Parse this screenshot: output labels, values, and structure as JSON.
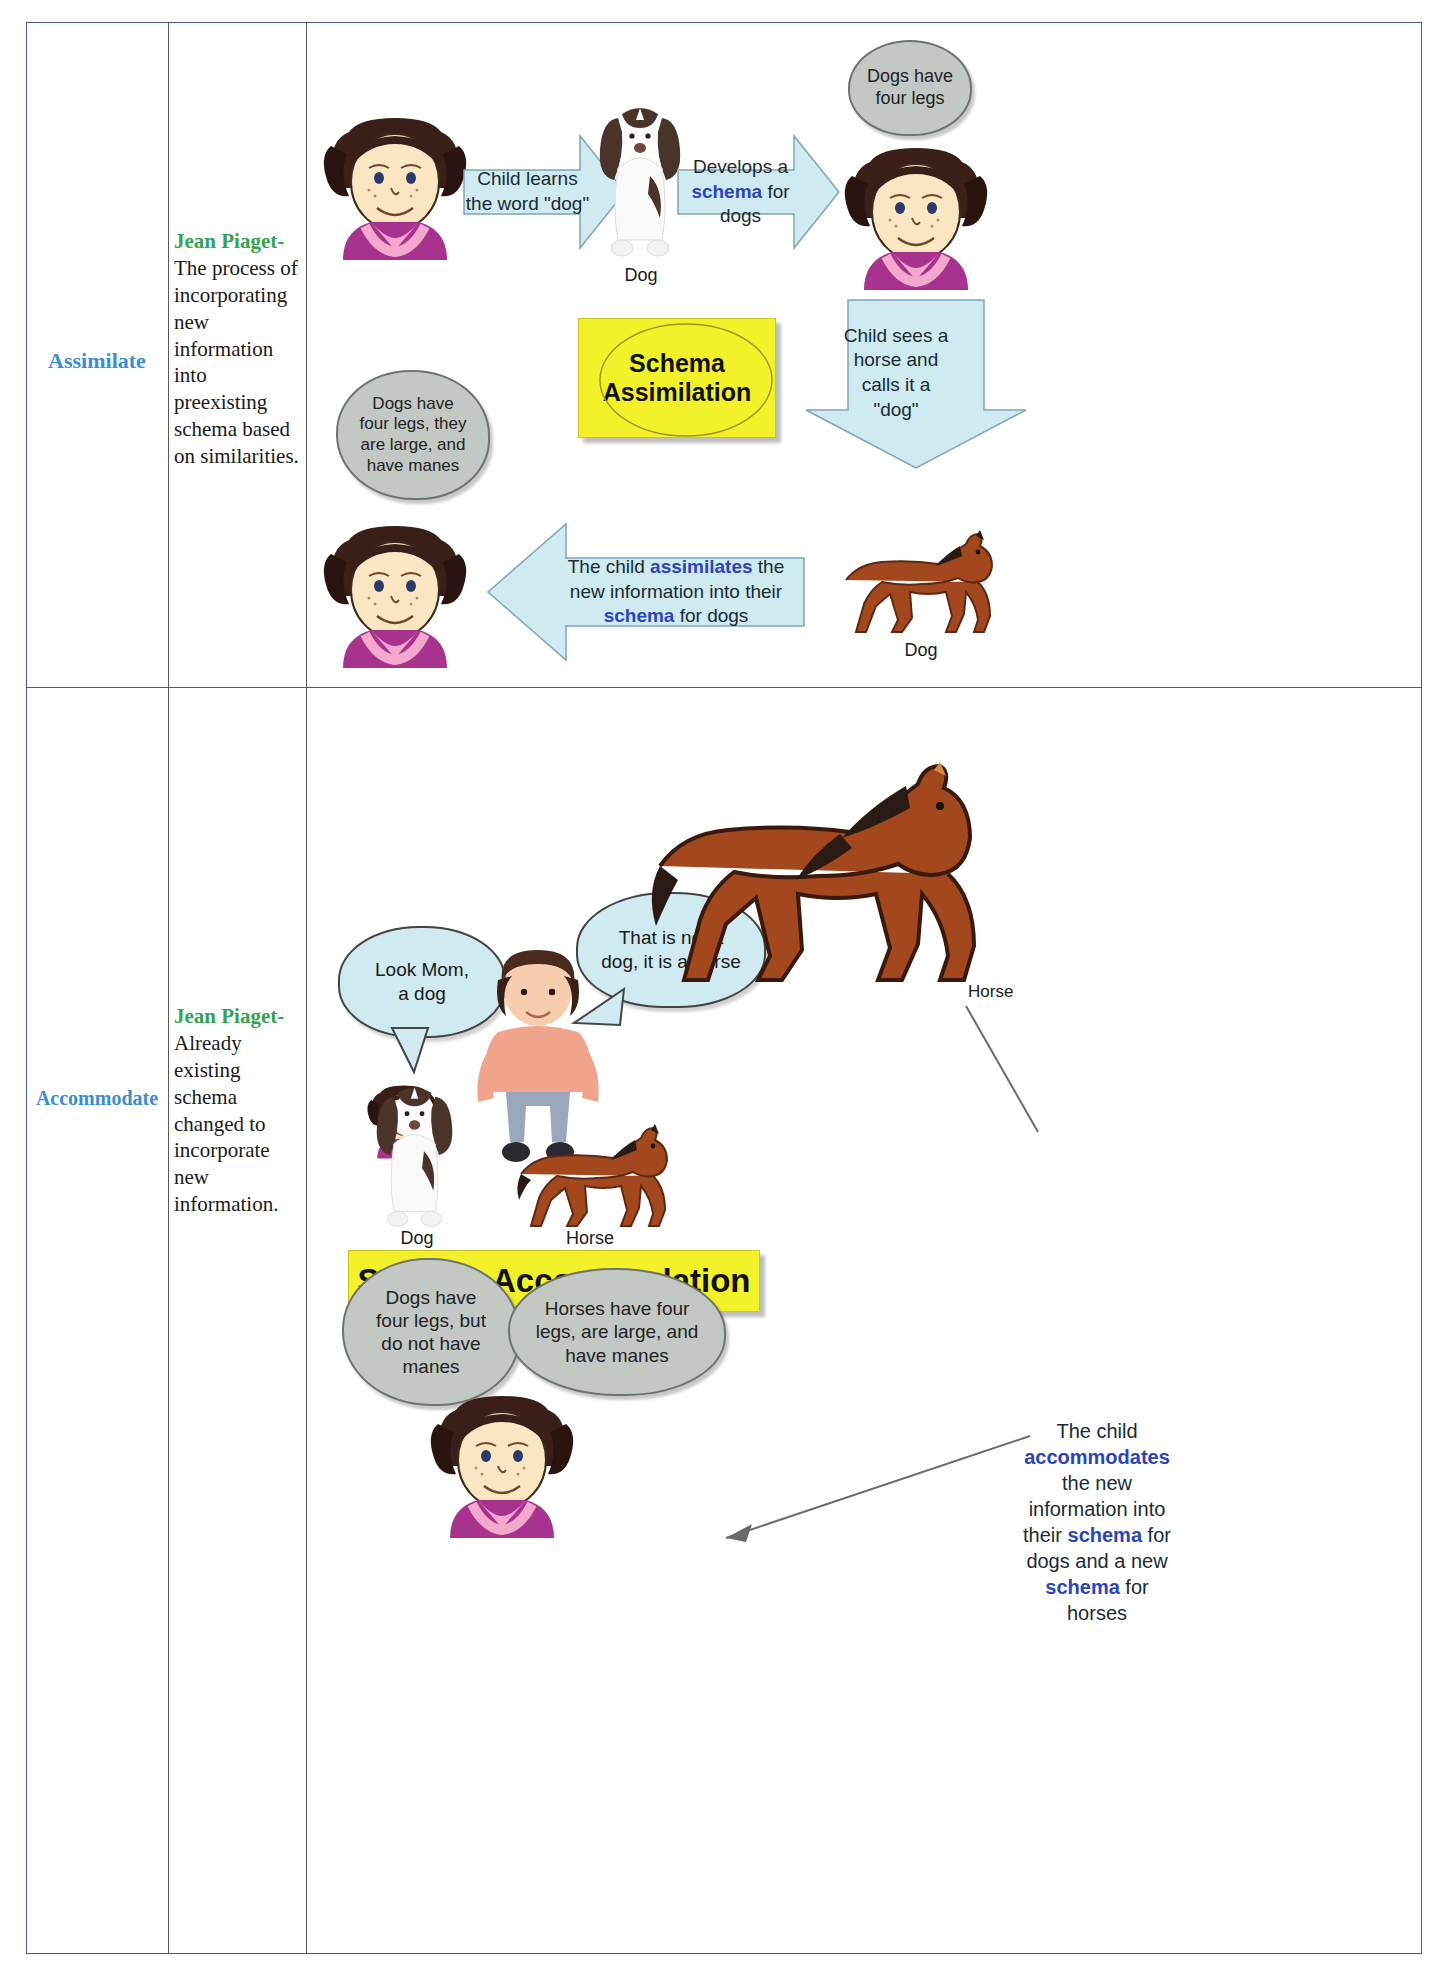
{
  "document": {
    "type": "two-row comparison table of Piaget cognitive terms",
    "columns": [
      "Term",
      "Definition",
      "Illustration"
    ]
  },
  "rows": [
    {
      "term": "Assimilate",
      "definition_author": "Jean Piaget-",
      "definition_text": "The process of incorporating new information into preexisting schema based on similarities.",
      "diagram": {
        "banner": "Schema\nAssimilation",
        "banner_line1": "Schema",
        "banner_line2": "Assimilation",
        "arrow1_text": "Child learns\nthe word \"dog\"",
        "arrow1_line1": "Child learns",
        "arrow1_line2": "the word \"dog\"",
        "arrow2_line1": "Develops a",
        "arrow2_kw": "schema",
        "arrow2_line2_rest": " for",
        "arrow2_line3": "dogs",
        "cloud_top_right": "Dogs have\nfour legs",
        "cloud_top_right_l1": "Dogs have",
        "cloud_top_right_l2": "four legs",
        "cloud_left": "Dogs have four legs, they are large, and have manes",
        "cloud_left_l1": "Dogs have",
        "cloud_left_l2": "four legs, they",
        "cloud_left_l3": "are large, and",
        "cloud_left_l4": "have manes",
        "arrow_right_down_l1": "Child sees a",
        "arrow_right_down_l2": "horse and",
        "arrow_right_down_l3": "calls it a",
        "arrow_right_down_l4": "\"dog\"",
        "arrow_bottom_pre": "The child ",
        "arrow_bottom_kw1": "assimilates",
        "arrow_bottom_mid": " the new information into their ",
        "arrow_bottom_kw2": "schema",
        "arrow_bottom_post": " for dogs",
        "caption_dog_top": "Dog",
        "caption_dog_bottom": "Dog"
      }
    },
    {
      "term": "Accommodate",
      "definition_author": "Jean Piaget-",
      "definition_text": "Already existing schema changed to incorporate new information.",
      "diagram": {
        "banner": "Schema Accommodation",
        "bubble_child_l1": "Look Mom,",
        "bubble_child_l2": "a dog",
        "bubble_mom_l1": "That is not a",
        "bubble_mom_l2": "dog, it is a horse",
        "caption_horse_top": "Horse",
        "caption_dog": "Dog",
        "caption_horse": "Horse",
        "cloud_dog_l1": "Dogs have",
        "cloud_dog_l2": "four legs, but",
        "cloud_dog_l3": "do not have",
        "cloud_dog_l4": "manes",
        "cloud_horse_l1": "Horses have four",
        "cloud_horse_l2": "legs, are large, and",
        "cloud_horse_l3": "have manes",
        "side_pre": "The child ",
        "side_kw1": "accommodates",
        "side_mid": " the new information into their ",
        "side_kw2": "schema",
        "side_mid2": " for dogs and a new ",
        "side_kw3": "schema",
        "side_post": " for horses",
        "side_l1": "The child",
        "side_l2": "accommodates",
        "side_l3": "the new",
        "side_l4": "information into",
        "side_l5a": "their ",
        "side_l5b": "schema",
        "side_l5c": " for",
        "side_l6": "dogs and a new",
        "side_l7": "schema",
        "side_l7b": " for",
        "side_l8": "horses"
      }
    }
  ],
  "colors": {
    "term": "#3a8ed0",
    "author": "#35a352",
    "keyword": "#2b45b8",
    "arrow_fill": "#cfeaf0",
    "cloud_fill": "#c3c8c4",
    "banner_fill": "#f2f12a",
    "table_border": "#4a5a8a"
  }
}
